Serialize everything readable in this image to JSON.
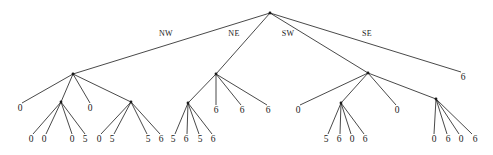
{
  "figure": {
    "type": "tree-diagram",
    "width": 493,
    "height": 155,
    "background_color": "#ffffff",
    "line_color": "#1a1a1a"
  },
  "edge_labels": [
    {
      "text": "NW",
      "x": 166,
      "y": 36
    },
    {
      "text": "NE",
      "x": 234,
      "y": 36
    },
    {
      "text": "SW",
      "x": 288,
      "y": 36
    },
    {
      "text": "SE",
      "x": 367,
      "y": 36
    }
  ],
  "nodes": {
    "root": {
      "x": 270,
      "y": 13
    },
    "internal": [
      {
        "id": "nw",
        "x": 73,
        "y": 74
      },
      {
        "id": "nw-c2",
        "x": 61,
        "y": 102
      },
      {
        "id": "nw-c4",
        "x": 131,
        "y": 102
      },
      {
        "id": "ne",
        "x": 216,
        "y": 74
      },
      {
        "id": "ne-c1",
        "x": 188,
        "y": 103
      },
      {
        "id": "sw",
        "x": 368,
        "y": 73
      },
      {
        "id": "sw-c2",
        "x": 341,
        "y": 103
      },
      {
        "id": "sw-c4",
        "x": 436,
        "y": 99
      }
    ]
  },
  "leaves": [
    {
      "value": "0",
      "x": 20,
      "y": 111,
      "tip_x": 22,
      "tip_y": 103
    },
    {
      "value": "0",
      "x": 31,
      "y": 142,
      "tip_x": 33,
      "tip_y": 134
    },
    {
      "value": "0",
      "x": 44,
      "y": 142,
      "tip_x": 46,
      "tip_y": 134
    },
    {
      "value": "0",
      "x": 72,
      "y": 142,
      "tip_x": 72,
      "tip_y": 134
    },
    {
      "value": "5",
      "x": 85,
      "y": 142,
      "tip_x": 85,
      "tip_y": 134
    },
    {
      "value": "0",
      "x": 90,
      "y": 111,
      "tip_x": 90,
      "tip_y": 103
    },
    {
      "value": "0",
      "x": 99,
      "y": 142,
      "tip_x": 101,
      "tip_y": 134
    },
    {
      "value": "5",
      "x": 112,
      "y": 142,
      "tip_x": 114,
      "tip_y": 134
    },
    {
      "value": "5",
      "x": 148,
      "y": 142,
      "tip_x": 147,
      "tip_y": 134
    },
    {
      "value": "6",
      "x": 161,
      "y": 142,
      "tip_x": 160,
      "tip_y": 134
    },
    {
      "value": "5",
      "x": 173,
      "y": 142,
      "tip_x": 175,
      "tip_y": 134
    },
    {
      "value": "6",
      "x": 186,
      "y": 142,
      "tip_x": 187,
      "tip_y": 134
    },
    {
      "value": "5",
      "x": 200,
      "y": 142,
      "tip_x": 199,
      "tip_y": 134
    },
    {
      "value": "6",
      "x": 213,
      "y": 142,
      "tip_x": 212,
      "tip_y": 134
    },
    {
      "value": "6",
      "x": 216,
      "y": 113,
      "tip_x": 216,
      "tip_y": 105
    },
    {
      "value": "6",
      "x": 242,
      "y": 113,
      "tip_x": 241,
      "tip_y": 105
    },
    {
      "value": "6",
      "x": 268,
      "y": 113,
      "tip_x": 267,
      "tip_y": 105
    },
    {
      "value": "0",
      "x": 298,
      "y": 113,
      "tip_x": 300,
      "tip_y": 105
    },
    {
      "value": "5",
      "x": 326,
      "y": 142,
      "tip_x": 328,
      "tip_y": 134
    },
    {
      "value": "6",
      "x": 339,
      "y": 142,
      "tip_x": 340,
      "tip_y": 134
    },
    {
      "value": "0",
      "x": 352,
      "y": 142,
      "tip_x": 351,
      "tip_y": 134
    },
    {
      "value": "6",
      "x": 365,
      "y": 142,
      "tip_x": 364,
      "tip_y": 134
    },
    {
      "value": "0",
      "x": 397,
      "y": 113,
      "tip_x": 396,
      "tip_y": 105
    },
    {
      "value": "6",
      "x": 463,
      "y": 80,
      "tip_x": 461,
      "tip_y": 72
    },
    {
      "value": "0",
      "x": 434,
      "y": 142,
      "tip_x": 434,
      "tip_y": 134
    },
    {
      "value": "6",
      "x": 448,
      "y": 142,
      "tip_x": 447,
      "tip_y": 134
    },
    {
      "value": "0",
      "x": 461,
      "y": 142,
      "tip_x": 459,
      "tip_y": 134
    },
    {
      "value": "6",
      "x": 475,
      "y": 142,
      "tip_x": 472,
      "tip_y": 134
    }
  ],
  "edges": [
    {
      "x1": 270,
      "y1": 13,
      "x2": 73,
      "y2": 74,
      "label": "NW"
    },
    {
      "x1": 270,
      "y1": 13,
      "x2": 216,
      "y2": 74,
      "label": "NE"
    },
    {
      "x1": 270,
      "y1": 13,
      "x2": 368,
      "y2": 73,
      "label": "SW"
    },
    {
      "x1": 270,
      "y1": 13,
      "x2": 461,
      "y2": 72,
      "label": "SE"
    },
    {
      "x1": 73,
      "y1": 74,
      "x2": 22,
      "y2": 103
    },
    {
      "x1": 73,
      "y1": 74,
      "x2": 61,
      "y2": 102
    },
    {
      "x1": 73,
      "y1": 74,
      "x2": 90,
      "y2": 103
    },
    {
      "x1": 73,
      "y1": 74,
      "x2": 131,
      "y2": 102
    },
    {
      "x1": 61,
      "y1": 102,
      "x2": 33,
      "y2": 134
    },
    {
      "x1": 61,
      "y1": 102,
      "x2": 46,
      "y2": 134
    },
    {
      "x1": 61,
      "y1": 102,
      "x2": 72,
      "y2": 134
    },
    {
      "x1": 61,
      "y1": 102,
      "x2": 85,
      "y2": 134
    },
    {
      "x1": 131,
      "y1": 102,
      "x2": 101,
      "y2": 134
    },
    {
      "x1": 131,
      "y1": 102,
      "x2": 114,
      "y2": 134
    },
    {
      "x1": 131,
      "y1": 102,
      "x2": 147,
      "y2": 134
    },
    {
      "x1": 131,
      "y1": 102,
      "x2": 160,
      "y2": 134
    },
    {
      "x1": 216,
      "y1": 74,
      "x2": 188,
      "y2": 103
    },
    {
      "x1": 216,
      "y1": 74,
      "x2": 216,
      "y2": 105
    },
    {
      "x1": 216,
      "y1": 74,
      "x2": 241,
      "y2": 105
    },
    {
      "x1": 216,
      "y1": 74,
      "x2": 267,
      "y2": 105
    },
    {
      "x1": 188,
      "y1": 103,
      "x2": 175,
      "y2": 134
    },
    {
      "x1": 188,
      "y1": 103,
      "x2": 187,
      "y2": 134
    },
    {
      "x1": 188,
      "y1": 103,
      "x2": 199,
      "y2": 134
    },
    {
      "x1": 188,
      "y1": 103,
      "x2": 212,
      "y2": 134
    },
    {
      "x1": 368,
      "y1": 73,
      "x2": 300,
      "y2": 105
    },
    {
      "x1": 368,
      "y1": 73,
      "x2": 341,
      "y2": 103
    },
    {
      "x1": 368,
      "y1": 73,
      "x2": 396,
      "y2": 105
    },
    {
      "x1": 368,
      "y1": 73,
      "x2": 436,
      "y2": 99
    },
    {
      "x1": 341,
      "y1": 103,
      "x2": 328,
      "y2": 134
    },
    {
      "x1": 341,
      "y1": 103,
      "x2": 340,
      "y2": 134
    },
    {
      "x1": 341,
      "y1": 103,
      "x2": 351,
      "y2": 134
    },
    {
      "x1": 341,
      "y1": 103,
      "x2": 364,
      "y2": 134
    },
    {
      "x1": 436,
      "y1": 99,
      "x2": 434,
      "y2": 134
    },
    {
      "x1": 436,
      "y1": 99,
      "x2": 447,
      "y2": 134
    },
    {
      "x1": 436,
      "y1": 99,
      "x2": 459,
      "y2": 134
    },
    {
      "x1": 436,
      "y1": 99,
      "x2": 472,
      "y2": 134
    }
  ]
}
